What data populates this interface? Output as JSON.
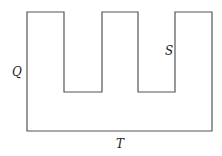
{
  "diagram": {
    "shape": "E-shaped outline (comb with two rectangular notches from top)",
    "stroke_color": "#555555",
    "background": "#ffffff",
    "outline_points": [
      [
        27,
        12
      ],
      [
        64,
        12
      ],
      [
        64,
        92
      ],
      [
        102,
        92
      ],
      [
        102,
        12
      ],
      [
        138,
        12
      ],
      [
        138,
        92
      ],
      [
        175,
        92
      ],
      [
        175,
        12
      ],
      [
        212,
        12
      ],
      [
        212,
        131
      ],
      [
        27,
        131
      ]
    ],
    "labels": {
      "left": "Q",
      "inner_right": "S",
      "bottom": "T"
    }
  }
}
